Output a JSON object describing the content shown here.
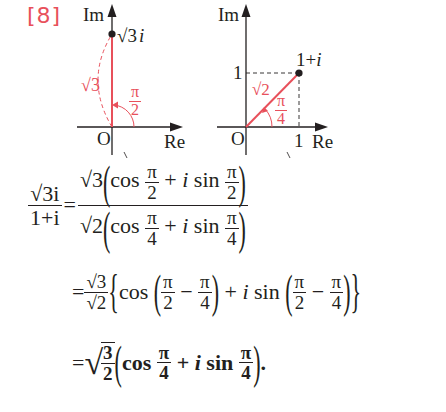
{
  "problem_number": "[8]",
  "colors": {
    "accent": "#e8505b",
    "ink": "#231f20",
    "background": "#ffffff"
  },
  "diagram_left": {
    "axis_im_label": "Im",
    "axis_re_label": "Re",
    "origin_label": "O",
    "point_label": "√3 i",
    "point_label_root": "√3",
    "point_label_var": "i",
    "modulus_label": "√3",
    "argument_label_num": "π",
    "argument_label_den": "2"
  },
  "diagram_right": {
    "axis_im_label": "Im",
    "axis_re_label": "Re",
    "origin_label": "O",
    "point_label": "1+i",
    "im_tick_label": "1",
    "re_tick_label": "1",
    "modulus_label": "√2",
    "argument_label_num": "π",
    "argument_label_den": "4"
  },
  "equations": {
    "line1": {
      "lhs_num": "√3i",
      "lhs_den": "1+i",
      "equals": "=",
      "rhs_num_coef": "√3",
      "rhs_den_coef": "√2",
      "cos": "cos",
      "plus_isin": "+ i sin",
      "num_angle_num": "π",
      "num_angle_den": "2",
      "den_angle_num": "π",
      "den_angle_den": "4"
    },
    "line2": {
      "equals": "=",
      "coef_num": "√3",
      "coef_den": "√2",
      "cos": "cos",
      "plus_isin": "+ i sin",
      "a_num": "π",
      "a_den": "2",
      "minus": "−",
      "b_num": "π",
      "b_den": "4"
    },
    "line3": {
      "equals": "=",
      "root_num": "3",
      "root_den": "2",
      "cos": "cos",
      "plus": "+",
      "i": "i",
      "sin": "sin",
      "angle_num": "π",
      "angle_den": "4",
      "period": "."
    }
  }
}
